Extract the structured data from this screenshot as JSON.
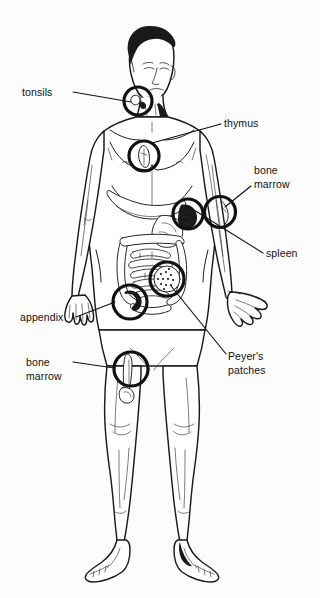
{
  "figure": {
    "background_color": "#fcfcfc",
    "ink_color": "#111111"
  },
  "labels": [
    {
      "id": "tonsils",
      "text": "tonsils",
      "lines": [
        "tonsils"
      ],
      "text_x": 22,
      "text_y": 96,
      "anchor": "start",
      "leader": "M 73,92 L 131,102",
      "callout": {
        "cx": 138,
        "cy": 101,
        "r": 14
      }
    },
    {
      "id": "thymus",
      "text": "thymus",
      "lines": [
        "thymus"
      ],
      "text_x": 224,
      "text_y": 127,
      "anchor": "start",
      "leader": "M 221,124 L 152,143",
      "callout": {
        "cx": 144,
        "cy": 156,
        "r": 15
      }
    },
    {
      "id": "bone-marrow-upper",
      "text": "bone marrow",
      "lines": [
        "bone",
        "marrow"
      ],
      "text_x": 254,
      "text_y": 174,
      "anchor": "start",
      "leader": "M 251,186 L 225,207",
      "callout": {
        "cx": 220,
        "cy": 212,
        "r": 15.5
      }
    },
    {
      "id": "spleen",
      "text": "spleen",
      "lines": [
        "spleen"
      ],
      "text_x": 266,
      "text_y": 257,
      "anchor": "start",
      "leader": "M 263,253 L 194,210",
      "callout": {
        "cx": 188,
        "cy": 214,
        "r": 15
      }
    },
    {
      "id": "peyers-patches",
      "text": "Peyer's patches",
      "lines": [
        "Peyer's",
        "patches"
      ],
      "text_x": 228,
      "text_y": 360,
      "anchor": "start",
      "leader": "M 226,354 L 171,286",
      "callout": {
        "cx": 167,
        "cy": 279,
        "r": 17
      }
    },
    {
      "id": "appendix",
      "text": "appendix",
      "lines": [
        "appendix"
      ],
      "text_x": 20,
      "text_y": 321,
      "anchor": "start",
      "leader": "M 76,317 L 115,302",
      "callout": {
        "cx": 130,
        "cy": 302,
        "r": 17
      }
    },
    {
      "id": "bone-marrow-lower",
      "text": "bone marrow",
      "lines": [
        "bone",
        "marrow"
      ],
      "text_x": 26,
      "text_y": 366,
      "anchor": "start",
      "leader": "M 73,362 L 114,368",
      "callout": {
        "cx": 131,
        "cy": 369,
        "r": 17
      }
    }
  ]
}
